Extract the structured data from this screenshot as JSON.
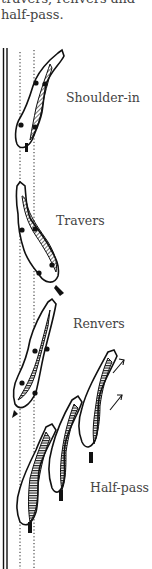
{
  "caption": {
    "line1": "travers, renvers and",
    "line2": "half-pass."
  },
  "labels": {
    "shoulder_in": "Shoulder-in",
    "travers": "Travers",
    "renvers": "Renvers",
    "half_pass": "Half-pass"
  },
  "colors": {
    "ink": "#111111",
    "text": "#444444",
    "background": "#ffffff"
  }
}
